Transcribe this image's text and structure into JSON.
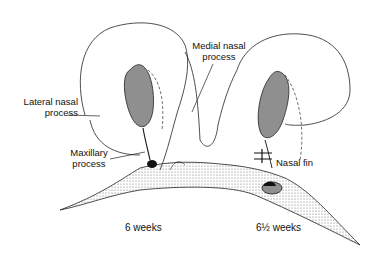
{
  "diagram": {
    "type": "anatomical illustration",
    "labels": {
      "lateral_nasal_process": [
        "Lateral nasal",
        "process"
      ],
      "medial_nasal_process": [
        "Medial nasal",
        "process"
      ],
      "maxillary_process": [
        "Maxillary",
        "process"
      ],
      "nasal_fin": "Nasal fin"
    },
    "captions": {
      "left_stage": "6 weeks",
      "right_stage": "6½ weeks"
    },
    "colors": {
      "line": "#222222",
      "stipple": "#555555",
      "background": "#ffffff"
    }
  }
}
